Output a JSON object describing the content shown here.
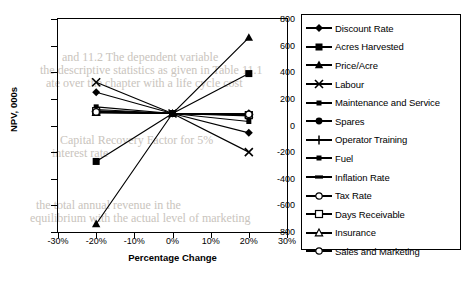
{
  "chart_data": {
    "type": "line",
    "title": "",
    "xlabel": "Percentage Change",
    "ylabel": "NPV, 000s",
    "xlim": [
      -30,
      30
    ],
    "ylim": [
      -800,
      800
    ],
    "x_ticks": [
      "-30%",
      "-20%",
      "-10%",
      "0%",
      "10%",
      "20%",
      "30%"
    ],
    "x_tick_values": [
      -30,
      -20,
      -10,
      0,
      10,
      20,
      30
    ],
    "y_ticks": [
      "800",
      "600",
      "400",
      "200",
      "0",
      "-200",
      "-400",
      "-600",
      "-800"
    ],
    "y_tick_values": [
      800,
      600,
      400,
      200,
      0,
      -200,
      -400,
      -600,
      -800
    ],
    "grid": false,
    "legend_position": "right",
    "x": [
      -20,
      0,
      20
    ],
    "series": [
      {
        "name": "Discount Rate",
        "marker": "diamond",
        "values": [
          250,
          90,
          -55
        ]
      },
      {
        "name": "Acres Harvested",
        "marker": "square-filled",
        "values": [
          -270,
          90,
          390
        ]
      },
      {
        "name": "Price/Acre",
        "marker": "triangle-filled",
        "values": [
          -740,
          90,
          660
        ]
      },
      {
        "name": "Labour",
        "marker": "cross-x",
        "values": [
          325,
          90,
          -200
        ]
      },
      {
        "name": "Maintenance and Service",
        "marker": "square-small",
        "values": [
          140,
          90,
          30
        ]
      },
      {
        "name": "Spares",
        "marker": "circle-filled",
        "values": [
          110,
          90,
          80
        ]
      },
      {
        "name": "Operator Training",
        "marker": "plus",
        "values": [
          105,
          90,
          82
        ]
      },
      {
        "name": "Fuel",
        "marker": "square-small",
        "values": [
          120,
          90,
          72
        ]
      },
      {
        "name": "Inflation Rate",
        "marker": "bar",
        "values": [
          95,
          90,
          88
        ]
      },
      {
        "name": "Tax Rate",
        "marker": "circle-open",
        "values": [
          100,
          90,
          85
        ]
      },
      {
        "name": "Days Receivable",
        "marker": "square-open",
        "values": [
          108,
          90,
          78
        ]
      },
      {
        "name": "Insurance",
        "marker": "triangle-open",
        "values": [
          98,
          90,
          86
        ]
      },
      {
        "name": "Sales and Marketing",
        "marker": "circle-open",
        "values": [
          102,
          90,
          84
        ]
      }
    ]
  },
  "legend": {
    "items": [
      {
        "label": "Discount Rate",
        "marker": "diamond"
      },
      {
        "label": "Acres Harvested",
        "marker": "square-filled"
      },
      {
        "label": "Price/Acre",
        "marker": "triangle-filled"
      },
      {
        "label": "Labour",
        "marker": "cross-x"
      },
      {
        "label": "Maintenance and Service",
        "marker": "square-small"
      },
      {
        "label": "Spares",
        "marker": "circle-filled"
      },
      {
        "label": "Operator Training",
        "marker": "plus"
      },
      {
        "label": "Fuel",
        "marker": "square-small"
      },
      {
        "label": "Inflation Rate",
        "marker": "bar"
      },
      {
        "label": "Tax Rate",
        "marker": "circle-open"
      },
      {
        "label": "Days Receivable",
        "marker": "square-open"
      },
      {
        "label": "Insurance",
        "marker": "triangle-open"
      },
      {
        "label": "Sales and Marketing",
        "marker": "circle-open"
      }
    ]
  },
  "colors": {
    "line": "#000000",
    "axis": "#000000",
    "background": "#ffffff",
    "bleed_text": "#c9c4bd"
  },
  "background_text": [
    {
      "text": "and 11.2  The dependent variable",
      "x": 62,
      "y": 50
    },
    {
      "text": "the descriptive statistics as given in Table 11.1",
      "x": 40,
      "y": 63
    },
    {
      "text": "ate over the chapter with a life cycle cost",
      "x": 46,
      "y": 76
    },
    {
      "text": "Capital Recovery Factor for 5%",
      "x": 60,
      "y": 133
    },
    {
      "text": "interest rate",
      "x": 52,
      "y": 146
    },
    {
      "text": "the total annual revenue in the",
      "x": 36,
      "y": 198
    },
    {
      "text": "equilibrium with the actual level of marketing",
      "x": 30,
      "y": 211
    }
  ]
}
